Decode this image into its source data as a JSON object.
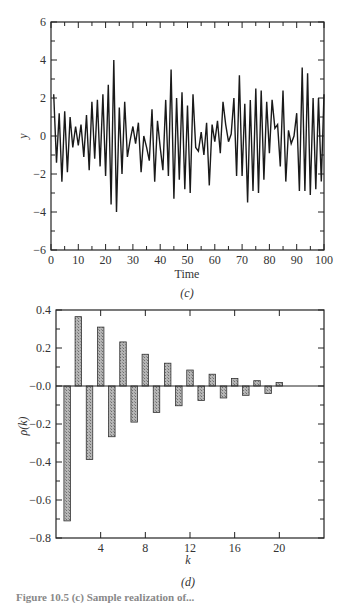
{
  "chart_data": [
    {
      "id": "c",
      "type": "line",
      "panel_label": "(c)",
      "title": "",
      "xlabel": "Time",
      "ylabel": "y",
      "xlim": [
        0,
        100
      ],
      "ylim": [
        -6,
        6
      ],
      "xticks": [
        0,
        10,
        20,
        30,
        40,
        50,
        60,
        70,
        80,
        90,
        100
      ],
      "yticks": [
        -6,
        -4,
        -2,
        0,
        2,
        4,
        6
      ],
      "grid": false,
      "legend": null,
      "line_color": "#1a1a1a",
      "x": [
        1,
        2,
        3,
        4,
        5,
        6,
        7,
        8,
        9,
        10,
        11,
        12,
        13,
        14,
        15,
        16,
        17,
        18,
        19,
        20,
        21,
        22,
        23,
        24,
        25,
        26,
        27,
        28,
        29,
        30,
        31,
        32,
        33,
        34,
        35,
        36,
        37,
        38,
        39,
        40,
        41,
        42,
        43,
        44,
        45,
        46,
        47,
        48,
        49,
        50,
        51,
        52,
        53,
        54,
        55,
        56,
        57,
        58,
        59,
        60,
        61,
        62,
        63,
        64,
        65,
        66,
        67,
        68,
        69,
        70,
        71,
        72,
        73,
        74,
        75,
        76,
        77,
        78,
        79,
        80,
        81,
        82,
        83,
        84,
        85,
        86,
        87,
        88,
        89,
        90,
        91,
        92,
        93,
        94,
        95,
        96,
        97,
        98,
        99,
        100
      ],
      "values": [
        2.2,
        -1.4,
        1.2,
        -2.4,
        1.3,
        -1.9,
        1.0,
        -0.6,
        0.5,
        -0.5,
        0.6,
        -1.1,
        1.1,
        -1.8,
        1.8,
        -1.2,
        1.9,
        -1.6,
        2.2,
        -2.1,
        2.7,
        -3.6,
        4.0,
        -4.0,
        1.5,
        -2.0,
        1.8,
        -1.1,
        -0.2,
        0.5,
        -0.4,
        0.7,
        -1.9,
        0.0,
        -0.6,
        -1.3,
        1.4,
        -2.4,
        0.8,
        -0.6,
        -1.8,
        1.9,
        -2.1,
        3.5,
        -3.3,
        2.0,
        -2.3,
        2.3,
        -2.8,
        1.6,
        -3.0,
        2.2,
        -0.6,
        -0.8,
        0.2,
        -1.0,
        0.7,
        -2.6,
        0.6,
        -0.3,
        0.8,
        -0.9,
        1.8,
        0.6,
        -0.3,
        0.1,
        2.0,
        -2.1,
        3.2,
        -2.1,
        1.7,
        -3.5,
        1.9,
        -2.9,
        2.5,
        -3.0,
        2.4,
        -2.3,
        1.8,
        -0.9,
        1.9,
        0.4,
        0.6,
        -1.6,
        2.4,
        -2.4,
        0.3,
        -0.4,
        0.0,
        1.2,
        -2.9,
        3.6,
        -2.9,
        3.3,
        -3.1,
        2.0,
        -2.8,
        2.0,
        -2.4,
        2.2
      ]
    },
    {
      "id": "d",
      "type": "bar",
      "panel_label": "(d)",
      "title": "",
      "xlabel": "k",
      "ylabel": "ρ(k)",
      "xlim": [
        0,
        24
      ],
      "ylim": [
        -0.8,
        0.4
      ],
      "xticks": [
        4,
        8,
        12,
        16,
        20
      ],
      "yticks": [
        0.4,
        0.2,
        0.0,
        -0.2,
        -0.4,
        -0.6,
        -0.8
      ],
      "ytick_labels": [
        "0.4",
        "0.2",
        "-0.0",
        "-0.2",
        "-0.4",
        "-0.6",
        "-0.8"
      ],
      "grid": false,
      "legend": null,
      "bar_fill": "#a8a8a8",
      "bar_edge": "#333333",
      "categories": [
        1,
        2,
        3,
        4,
        5,
        6,
        7,
        8,
        9,
        10,
        11,
        12,
        13,
        14,
        15,
        16,
        17,
        18,
        19,
        20
      ],
      "values": [
        -0.71,
        0.365,
        -0.387,
        0.31,
        -0.267,
        0.232,
        -0.19,
        0.167,
        -0.139,
        0.12,
        -0.104,
        0.084,
        -0.076,
        0.062,
        -0.063,
        0.04,
        -0.049,
        0.028,
        -0.039,
        0.018
      ]
    }
  ],
  "caption": "Figure 10.5 (c) Sample realization of..."
}
